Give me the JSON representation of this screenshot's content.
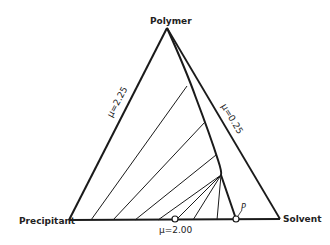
{
  "diagram": {
    "type": "ternary-phase-diagram",
    "vertices": {
      "top": "Polymer",
      "left": "Precipitant",
      "right": "Solvent"
    },
    "edge_labels": {
      "left_edge": "μ=2.25",
      "right_edge": "μ=0.25",
      "bottom_edge": "μ=2.00"
    },
    "point_label": "P",
    "colors": {
      "line": "#1a1a1a",
      "background": "#ffffff"
    }
  }
}
